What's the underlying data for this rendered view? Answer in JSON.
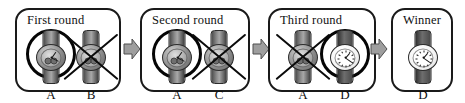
{
  "diagram": {
    "type": "flow-bracket",
    "colors": {
      "panel_border": "#1a1a1a",
      "background": "#ffffff",
      "arrow_fill": "#9e9e9e",
      "arrow_stroke": "#4f4f4f",
      "mark_color": "#0b0b0b",
      "ring_color": "#050505"
    },
    "panels": [
      {
        "id": "panel-first-round",
        "title": "First round",
        "slots": [
          {
            "label": "A",
            "state": "winner",
            "watch_style": "chronograph-dark"
          },
          {
            "label": "B",
            "state": "eliminated",
            "watch_style": "dark-metal"
          }
        ]
      },
      {
        "id": "panel-second-round",
        "title": "Second round",
        "slots": [
          {
            "label": "A",
            "state": "winner",
            "watch_style": "chronograph-dark"
          },
          {
            "label": "C",
            "state": "eliminated",
            "watch_style": "dark-metal"
          }
        ]
      },
      {
        "id": "panel-third-round",
        "title": "Third round",
        "slots": [
          {
            "label": "A",
            "state": "eliminated",
            "watch_style": "chronograph-dark"
          },
          {
            "label": "D",
            "state": "winner",
            "watch_style": "white-dial"
          }
        ]
      },
      {
        "id": "panel-winner",
        "title": "Winner",
        "slots": [
          {
            "label": "D",
            "state": "plain",
            "watch_style": "white-dial"
          }
        ]
      }
    ],
    "arrows": [
      {
        "id": "arrow-1",
        "from": "panel-first-round",
        "to": "panel-second-round",
        "direction": "right"
      },
      {
        "id": "arrow-2",
        "from": "panel-second-round",
        "to": "panel-third-round",
        "direction": "right"
      },
      {
        "id": "arrow-3",
        "from": "panel-third-round",
        "to": "panel-winner",
        "direction": "right"
      }
    ]
  }
}
